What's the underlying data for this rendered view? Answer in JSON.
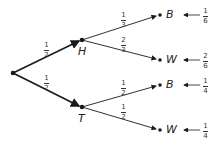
{
  "diagram": {
    "type": "probability-tree",
    "root": {
      "x": 13,
      "y": 73
    },
    "first_level": [
      {
        "id": "H",
        "label": "H",
        "probability": {
          "num": "1",
          "den": "2"
        },
        "x": 82,
        "y": 40
      },
      {
        "id": "T",
        "label": "T",
        "probability": {
          "num": "1",
          "den": "2"
        },
        "x": 82,
        "y": 107
      }
    ],
    "second_level": [
      {
        "parent": "H",
        "label": "B",
        "probability": {
          "num": "1",
          "den": "3"
        },
        "outcome": {
          "num": "1",
          "den": "6"
        },
        "x": 160,
        "y": 15
      },
      {
        "parent": "H",
        "label": "W",
        "probability": {
          "num": "2",
          "den": "3"
        },
        "outcome": {
          "num": "2",
          "den": "6"
        },
        "x": 160,
        "y": 60
      },
      {
        "parent": "T",
        "label": "B",
        "probability": {
          "num": "1",
          "den": "2"
        },
        "outcome": {
          "num": "1",
          "den": "4"
        },
        "x": 160,
        "y": 85
      },
      {
        "parent": "T",
        "label": "W",
        "probability": {
          "num": "1",
          "den": "2"
        },
        "outcome": {
          "num": "1",
          "den": "4"
        },
        "x": 160,
        "y": 130
      }
    ],
    "colors": {
      "line": "#1a1a1a",
      "text": "#222222"
    }
  }
}
